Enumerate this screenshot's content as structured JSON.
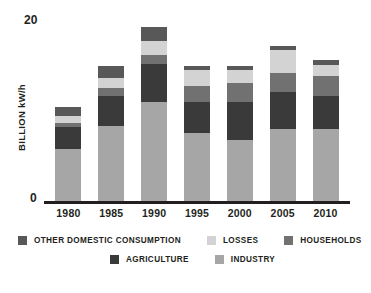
{
  "chart_data": {
    "type": "bar",
    "subtype": "stacked-bar",
    "title": "",
    "xlabel": "",
    "ylabel": "BILLION kW/h",
    "ylim": [
      0,
      20
    ],
    "yticks": [
      "0",
      "20"
    ],
    "grid": false,
    "legend_position": "bottom",
    "categories": [
      "1980",
      "1985",
      "1990",
      "1995",
      "2000",
      "2005",
      "2010"
    ],
    "series": [
      {
        "name": "INDUSTRY",
        "color": "#a6a6a6",
        "values": [
          5.8,
          8.4,
          11.0,
          7.6,
          6.8,
          8.0,
          8.0
        ]
      },
      {
        "name": "AGRICULTURE",
        "color": "#3a3a3a",
        "values": [
          2.4,
          3.2,
          4.2,
          3.4,
          4.2,
          4.1,
          3.6
        ]
      },
      {
        "name": "HOUSEHOLDS",
        "color": "#717171",
        "values": [
          0.5,
          0.9,
          1.0,
          1.7,
          2.1,
          2.1,
          2.3
        ]
      },
      {
        "name": "LOSSES",
        "color": "#d3d3d3",
        "values": [
          0.8,
          1.1,
          1.5,
          1.8,
          1.4,
          2.5,
          1.2
        ]
      },
      {
        "name": "OTHER DOMESTIC CONSUMPTION",
        "color": "#585858",
        "values": [
          0.9,
          1.3,
          1.5,
          0.4,
          0.5,
          0.5,
          0.5
        ]
      }
    ],
    "totals": [
      10.4,
      14.9,
      19.2,
      14.9,
      15.0,
      17.2,
      15.6
    ]
  },
  "legend": {
    "row1": [
      {
        "label": "OTHER DOMESTIC CONSUMPTION",
        "color": "#585858"
      },
      {
        "label": "LOSSES",
        "color": "#d3d3d3"
      },
      {
        "label": "HOUSEHOLDS",
        "color": "#717171"
      }
    ],
    "row2": [
      {
        "label": "AGRICULTURE",
        "color": "#3a3a3a"
      },
      {
        "label": "INDUSTRY",
        "color": "#a6a6a6"
      }
    ]
  }
}
